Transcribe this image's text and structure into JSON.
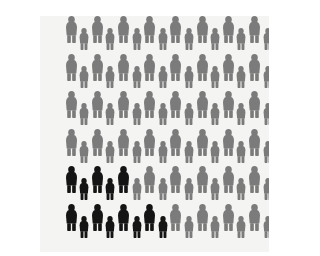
{
  "figure": {
    "description": "Grid of human silhouettes; a subset in the lower-left is highlighted in dark to represent an affected proportion of the population.",
    "type": "pictogram",
    "background_color": "#f4f4f2",
    "width": 229,
    "height": 236
  },
  "chart_data": {
    "type": "pictogram",
    "xlabel": "",
    "ylabel": "",
    "unit_label": "person",
    "grid": {
      "columns": 17,
      "rows": 6,
      "column_spacing_px": 13.1,
      "row_spacing_px": 37.5,
      "origin_x_px": 31,
      "origin_y_px": 27,
      "stagger": "alternating-column-baseline"
    },
    "icon_variants": [
      {
        "name": "tall-figure",
        "role": "primary",
        "height_px": 27,
        "width_px": 11,
        "baseline_offset_px": 0
      },
      {
        "name": "short-figure",
        "role": "secondary",
        "height_px": 22,
        "width_px": 10,
        "baseline_offset_px": 7
      }
    ],
    "categories": [
      "highlighted",
      "background"
    ],
    "colors": {
      "highlighted": "#141414",
      "background": "#7b7b7b",
      "page": "#f4f4f2"
    },
    "legend": [
      {
        "label": "Highlighted group",
        "color": "#141414",
        "count": 10
      },
      {
        "label": "Remaining population",
        "color": "#7b7b7b",
        "count": 92
      }
    ],
    "values": [
      10,
      92
    ],
    "total_icons": 102,
    "highlighted_count": 10,
    "background_count": 92,
    "highlighted_fraction": "10 of 102",
    "highlighted_percent": 9.8,
    "legend_position": "none",
    "grid_lines": false,
    "rows_detail": [
      {
        "row": 1,
        "icons": 17,
        "highlighted": 0
      },
      {
        "row": 2,
        "icons": 17,
        "highlighted": 0
      },
      {
        "row": 3,
        "icons": 17,
        "highlighted": 0
      },
      {
        "row": 4,
        "icons": 17,
        "highlighted": 0
      },
      {
        "row": 5,
        "icons": 17,
        "highlighted": 5
      },
      {
        "row": 6,
        "icons": 17,
        "highlighted": 5
      }
    ],
    "highlighted_cells": [
      {
        "row": 5,
        "col": 1
      },
      {
        "row": 5,
        "col": 2
      },
      {
        "row": 5,
        "col": 3
      },
      {
        "row": 5,
        "col": 4
      },
      {
        "row": 5,
        "col": 5
      },
      {
        "row": 6,
        "col": 1
      },
      {
        "row": 6,
        "col": 2
      },
      {
        "row": 6,
        "col": 3
      },
      {
        "row": 6,
        "col": 4
      },
      {
        "row": 6,
        "col": 5
      },
      {
        "row": 6,
        "col": 6
      },
      {
        "row": 6,
        "col": 7
      },
      {
        "row": 6,
        "col": 8
      }
    ],
    "annotations": []
  }
}
